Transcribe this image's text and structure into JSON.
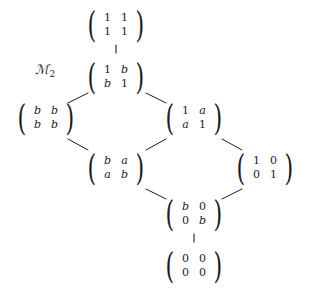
{
  "diagram": {
    "title_label": "ℳ",
    "title_subscript": "2",
    "type": "hasse-lattice",
    "width": 309,
    "height": 292,
    "background": "#ffffff",
    "ink_color": "#1b1b1b",
    "nodes": [
      {
        "id": "top",
        "name": "matrix-all-ones",
        "x": 116,
        "y": 25,
        "rows": [
          [
            "1",
            "1"
          ],
          [
            "1",
            "1"
          ]
        ],
        "italic": [
          [
            false,
            false
          ],
          [
            false,
            false
          ]
        ]
      },
      {
        "id": "one-b",
        "name": "matrix-1-b-b-1",
        "x": 116,
        "y": 77,
        "rows": [
          [
            "1",
            "b"
          ],
          [
            "b",
            "1"
          ]
        ],
        "italic": [
          [
            false,
            true
          ],
          [
            true,
            false
          ]
        ]
      },
      {
        "id": "all-b",
        "name": "matrix-all-b",
        "x": 46,
        "y": 118,
        "rows": [
          [
            "b",
            "b"
          ],
          [
            "b",
            "b"
          ]
        ],
        "italic": [
          [
            true,
            true
          ],
          [
            true,
            true
          ]
        ]
      },
      {
        "id": "one-a",
        "name": "matrix-1-a-a-1",
        "x": 194,
        "y": 118,
        "rows": [
          [
            "1",
            "a"
          ],
          [
            "a",
            "1"
          ]
        ],
        "italic": [
          [
            false,
            true
          ],
          [
            true,
            false
          ]
        ]
      },
      {
        "id": "b-a",
        "name": "matrix-b-a-a-b",
        "x": 116,
        "y": 168,
        "rows": [
          [
            "b",
            "a"
          ],
          [
            "a",
            "b"
          ]
        ],
        "italic": [
          [
            true,
            true
          ],
          [
            true,
            true
          ]
        ]
      },
      {
        "id": "identity",
        "name": "matrix-identity",
        "x": 265,
        "y": 168,
        "rows": [
          [
            "1",
            "0"
          ],
          [
            "0",
            "1"
          ]
        ],
        "italic": [
          [
            false,
            false
          ],
          [
            false,
            false
          ]
        ]
      },
      {
        "id": "diag-b",
        "name": "matrix-diagonal-b",
        "x": 194,
        "y": 214,
        "rows": [
          [
            "b",
            "0"
          ],
          [
            "0",
            "b"
          ]
        ],
        "italic": [
          [
            true,
            false
          ],
          [
            false,
            true
          ]
        ]
      },
      {
        "id": "zero",
        "name": "matrix-zero",
        "x": 194,
        "y": 266,
        "rows": [
          [
            "0",
            "0"
          ],
          [
            "0",
            "0"
          ]
        ],
        "italic": [
          [
            false,
            false
          ],
          [
            false,
            false
          ]
        ]
      }
    ],
    "edges": [
      {
        "name": "edge-top-to-one-b",
        "kind": "vertical",
        "x1": 116,
        "y1": 45,
        "x2": 116,
        "y2": 53
      },
      {
        "name": "edge-one-b-to-all-b",
        "kind": "diagonal",
        "x1": 68,
        "y1": 103,
        "x2": 88,
        "y2": 93
      },
      {
        "name": "edge-one-b-to-one-a",
        "kind": "diagonal",
        "x1": 146,
        "y1": 93,
        "x2": 166,
        "y2": 103
      },
      {
        "name": "edge-all-b-to-b-a",
        "kind": "diagonal",
        "x1": 68,
        "y1": 139,
        "x2": 88,
        "y2": 150
      },
      {
        "name": "edge-one-a-to-b-a",
        "kind": "diagonal",
        "x1": 146,
        "y1": 150,
        "x2": 166,
        "y2": 139
      },
      {
        "name": "edge-one-a-to-identity",
        "kind": "diagonal",
        "x1": 222,
        "y1": 139,
        "x2": 242,
        "y2": 150
      },
      {
        "name": "edge-b-a-to-diag-b",
        "kind": "diagonal",
        "x1": 146,
        "y1": 189,
        "x2": 166,
        "y2": 199
      },
      {
        "name": "edge-identity-to-diag-b",
        "kind": "diagonal",
        "x1": 222,
        "y1": 199,
        "x2": 242,
        "y2": 189
      },
      {
        "name": "edge-diag-b-to-zero",
        "kind": "vertical",
        "x1": 194,
        "y1": 234,
        "x2": 194,
        "y2": 242
      }
    ],
    "label": {
      "x": 45,
      "y": 70
    }
  }
}
